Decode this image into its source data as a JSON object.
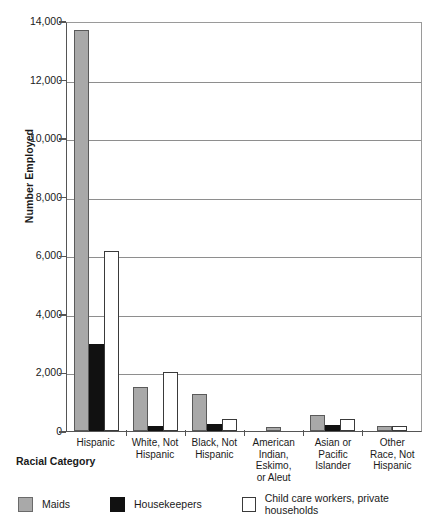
{
  "chart_data": {
    "type": "bar",
    "title": "",
    "xlabel": "Racial Category",
    "ylabel": "Number Employed",
    "ylim": [
      0,
      14000
    ],
    "yticks": [
      "0",
      "2,000",
      "4,000",
      "6,000",
      "8,000",
      "10,000",
      "12,000",
      "14,000"
    ],
    "ytick_values": [
      0,
      2000,
      4000,
      6000,
      8000,
      10000,
      12000,
      14000
    ],
    "grid": true,
    "legend_position": "bottom",
    "categories": [
      "Hispanic",
      "White, Not Hispanic",
      "Black, Not Hispanic",
      "American Indian, Eskimo, or Aleut",
      "Asian or Pacific Islander",
      "Other Race, Not Hispanic"
    ],
    "category_lines": [
      [
        "Hispanic"
      ],
      [
        "White, Not",
        "Hispanic"
      ],
      [
        "Black, Not",
        "Hispanic"
      ],
      [
        "American",
        "Indian,",
        "Eskimo,",
        "or Aleut"
      ],
      [
        "Asian or",
        "Pacific",
        "Islander"
      ],
      [
        "Other",
        "Race, Not",
        "Hispanic"
      ]
    ],
    "series": [
      {
        "name": "Maids",
        "color": "#a9a9a9",
        "values": [
          13700,
          1500,
          1250,
          130,
          550,
          170
        ]
      },
      {
        "name": "Housekeepers",
        "color": "#111111",
        "values": [
          2980,
          180,
          250,
          0,
          200,
          0
        ]
      },
      {
        "name": "Child care workers, private households",
        "color": "#ffffff",
        "values": [
          6150,
          2000,
          400,
          0,
          400,
          160
        ]
      }
    ]
  },
  "legend": {
    "items": [
      {
        "label": "Maids",
        "swatch": "maids"
      },
      {
        "label": "Housekeepers",
        "swatch": "housekeepers"
      },
      {
        "label": "Child care workers, private households",
        "swatch": "childcare"
      }
    ]
  }
}
